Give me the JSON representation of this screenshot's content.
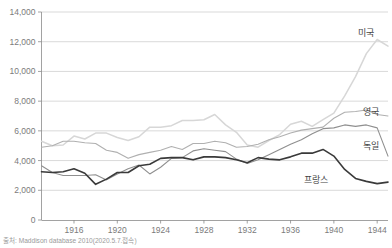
{
  "source_note": "출처: Maddison database 2010(2020.5.7.접속)",
  "axis": {
    "y_ticks": [
      "0",
      "2,000",
      "4,000",
      "6,000",
      "8,000",
      "10,000",
      "12,000",
      "14,000"
    ],
    "x_ticks": [
      "1916",
      "1920",
      "1924",
      "1928",
      "1932",
      "1936",
      "1940",
      "1944"
    ]
  },
  "series_labels": {
    "usa": "미국",
    "uk": "영국",
    "germany": "독일",
    "france": "프랑스"
  },
  "colors": {
    "usa": "#d7d7d7",
    "uk": "#b0b0b0",
    "germany": "#8f8f8f",
    "france": "#3a3a3a",
    "grid": "#c9c9c9",
    "axis": "#8a8a8a",
    "tick_text": "#7b7b7b",
    "label_text": "#444444",
    "source_text": "#9a9a9a",
    "background": "#ffffff"
  },
  "chart_data": {
    "type": "line",
    "title": "",
    "xlabel": "",
    "ylabel": "",
    "xlim": [
      1913,
      1945
    ],
    "ylim": [
      0,
      14000
    ],
    "ytick_step": 2000,
    "grid": true,
    "legend": "inline-right-of-line-ends",
    "x": [
      1913,
      1914,
      1915,
      1916,
      1917,
      1918,
      1919,
      1920,
      1921,
      1922,
      1923,
      1924,
      1925,
      1926,
      1927,
      1928,
      1929,
      1930,
      1931,
      1932,
      1933,
      1934,
      1935,
      1936,
      1937,
      1938,
      1939,
      1940,
      1941,
      1942,
      1943,
      1944,
      1945
    ],
    "series": [
      {
        "name": "미국",
        "key": "usa",
        "color": "#d7d7d7",
        "values": [
          5300,
          5000,
          5050,
          5650,
          5450,
          5850,
          5850,
          5550,
          5350,
          5600,
          6250,
          6250,
          6350,
          6700,
          6700,
          6750,
          7100,
          6400,
          5900,
          5050,
          4900,
          5350,
          5750,
          6450,
          6650,
          6300,
          6750,
          7200,
          8350,
          9650,
          11200,
          12150,
          11700
        ]
      },
      {
        "name": "영국",
        "key": "uk",
        "color": "#b0b0b0",
        "values": [
          4900,
          5000,
          5300,
          5300,
          5200,
          5150,
          4700,
          4550,
          4150,
          4400,
          4550,
          4700,
          4950,
          4750,
          5150,
          5150,
          5300,
          5200,
          4900,
          4950,
          5100,
          5400,
          5600,
          5850,
          6050,
          6150,
          6250,
          6850,
          7250,
          7300,
          7400,
          7100,
          7000
        ]
      },
      {
        "name": "독일",
        "key": "germany",
        "color": "#8f8f8f",
        "values": [
          3650,
          3200,
          3000,
          3000,
          3000,
          3050,
          2700,
          3100,
          3450,
          3700,
          3100,
          3550,
          4150,
          4200,
          4650,
          4800,
          4700,
          4600,
          4100,
          3800,
          4050,
          4400,
          4750,
          5100,
          5400,
          5800,
          6150,
          6200,
          6400,
          6300,
          6400,
          6200,
          4300
        ]
      },
      {
        "name": "프랑스",
        "key": "france",
        "color": "#3a3a3a",
        "values": [
          3250,
          3200,
          3250,
          3450,
          3150,
          2400,
          2750,
          3200,
          3200,
          3650,
          3750,
          4150,
          4200,
          4200,
          4050,
          4250,
          4250,
          4200,
          4050,
          3850,
          4200,
          4100,
          4050,
          4250,
          4500,
          4500,
          4750,
          4300,
          3400,
          2800,
          2600,
          2450,
          2550
        ]
      }
    ]
  }
}
